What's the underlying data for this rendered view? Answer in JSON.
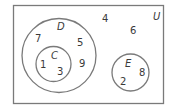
{
  "diagram": {
    "type": "venn",
    "universal_set": {
      "label": "U",
      "elements_outside_sets": [
        "4",
        "6"
      ]
    },
    "sets": {
      "D": {
        "label": "D",
        "elements_only_in_D": [
          "7",
          "5",
          "9"
        ]
      },
      "C": {
        "label": "C",
        "subset_of": "D",
        "elements": [
          "1",
          "3"
        ]
      },
      "E": {
        "label": "E",
        "elements": [
          "8",
          "2"
        ]
      }
    },
    "colors": {
      "stroke": "#7a7a7a",
      "text": "#3a3a3a",
      "background": "#ffffff"
    }
  },
  "labels": {
    "U": "U",
    "D": "D",
    "C": "C",
    "E": "E"
  },
  "numbers": {
    "n4": "4",
    "n6": "6",
    "n7": "7",
    "n5": "5",
    "n9": "9",
    "n1": "1",
    "n3": "3",
    "n8": "8",
    "n2": "2"
  }
}
